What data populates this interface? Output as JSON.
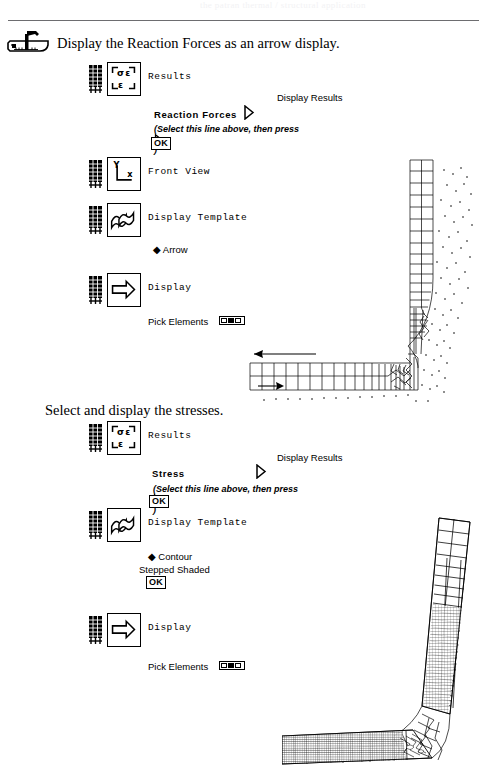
{
  "page": {
    "header_ghost": "the patran thermal / structural application",
    "background": "#ffffff",
    "ink": "#000000"
  },
  "sections": [
    {
      "id": "reaction-forces",
      "heading": "Display the Reaction Forces as an arrow display.",
      "icon": "hammer-anvil-icon",
      "rows": [
        {
          "id": "results-1",
          "icon": "results-sigma-epsilon-icon",
          "label": "Results"
        },
        {
          "id": "front-view",
          "icon": "front-view-axes-icon",
          "label": "Front View"
        },
        {
          "id": "display-template-1",
          "icon": "display-template-icon",
          "label": "Display Template"
        },
        {
          "id": "display-1",
          "icon": "display-arrow-icon",
          "label": "Display"
        }
      ],
      "form": {
        "panel_title": "Display Results",
        "selection": "Reaction  Forces",
        "hint_pre": "(Select this line above, then press",
        "hint_post": ")",
        "ok_label": "OK",
        "option_label": "Arrow",
        "pick_label": "Pick Elements"
      }
    },
    {
      "id": "stresses",
      "heading": "Select and display the stresses.",
      "icon": null,
      "rows": [
        {
          "id": "results-2",
          "icon": "results-sigma-epsilon-icon",
          "label": "Results"
        },
        {
          "id": "display-template-2",
          "icon": "display-template-icon",
          "label": "Display Template"
        },
        {
          "id": "display-2",
          "icon": "display-arrow-icon",
          "label": "Display"
        }
      ],
      "form": {
        "panel_title": "Display Results",
        "selection": "Stress",
        "hint_pre": "(Select this line above, then press",
        "hint_post": ")",
        "ok_label": "OK",
        "option_label": "Contour",
        "option_label_2": "Stepped Shaded",
        "ok_label_2": "OK",
        "pick_label": "Pick Elements"
      }
    }
  ],
  "figures": [
    {
      "id": "figure-reaction-forces",
      "name": "l-bracket-mesh-with-reaction-arrows",
      "description": "L-shaped bracket finite element mesh, front view, with reaction force arrow vectors"
    },
    {
      "id": "figure-stress-contour",
      "name": "l-bracket-mesh-stress-contour",
      "description": "L-shaped bracket finite element mesh, front view, stepped shaded stress contour"
    }
  ],
  "glyphs": {
    "triangle": "▷",
    "diamond": "◆",
    "sigma": "σ",
    "epsilon": "ε"
  }
}
